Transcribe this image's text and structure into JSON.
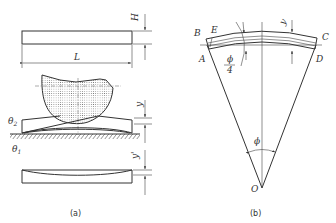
{
  "figure": {
    "panel_a": {
      "caption": "(a)",
      "labels": {
        "H": "H",
        "L": "L",
        "y": "y",
        "y_prime": "y'",
        "theta2": "θ2",
        "theta1": "θ1"
      },
      "theta2_base": "θ",
      "theta2_sub": "2",
      "theta1_base": "θ",
      "theta1_sub": "1"
    },
    "panel_b": {
      "caption": "(b)",
      "labels": {
        "B": "B",
        "E": "E",
        "C": "C",
        "A": "A",
        "D": "D",
        "O": "O",
        "y": "y",
        "phi": "ϕ",
        "phi_frac_num": "ϕ",
        "phi_frac_den": "4"
      }
    }
  }
}
